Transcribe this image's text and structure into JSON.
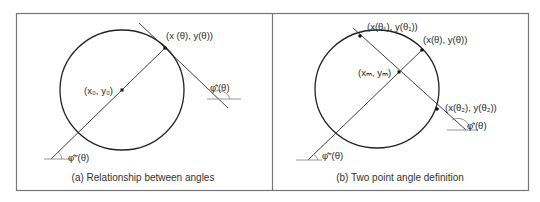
{
  "figure": {
    "panel_a": {
      "caption": "(a) Relationship between angles",
      "labels": {
        "point_theta": "(x (θ), y(θ))",
        "center": "(x₀, y₀)",
        "phi_prime": "φ̂′(θ)",
        "phi_double_prime": "φ̂″(θ)"
      }
    },
    "panel_b": {
      "caption": "(b) Two point angle definition",
      "labels": {
        "point_theta1": "(x(θ₁), y(θ₁))",
        "point_theta": "(x(θ), y(θ))",
        "midpoint": "(xₘ, yₘ)",
        "point_theta2": "(x(θ₂), y(θ₂))",
        "phi_prime": "φ̂′(θ)",
        "phi_double_prime": "φ̂″(θ)"
      }
    },
    "colors": {
      "line": "#2b2b2b",
      "frame": "#777777",
      "reference_line": "#8a8a8a",
      "text": "#2a2a2a"
    }
  }
}
